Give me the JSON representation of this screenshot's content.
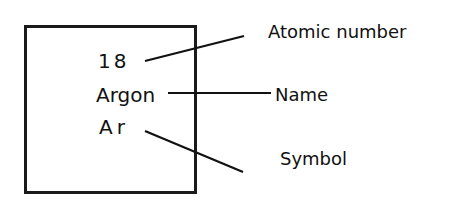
{
  "element": {
    "atomic_number": "18",
    "name": "Argon",
    "symbol": "Ar"
  },
  "labels": {
    "atomic_number": "Atomic number",
    "name": "Name",
    "symbol": "Symbol"
  },
  "colors": {
    "ink": "#111111",
    "background": "#ffffff"
  }
}
